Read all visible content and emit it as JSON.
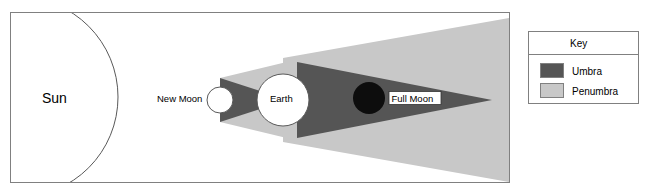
{
  "diagram": {
    "bodies": {
      "sun": {
        "label": "Sun"
      },
      "new_moon": {
        "label": "New Moon"
      },
      "earth": {
        "label": "Earth"
      },
      "full_moon": {
        "label": "Full Moon"
      }
    }
  },
  "legend": {
    "title": "Key",
    "items": [
      {
        "label": "Umbra",
        "color": "#555555"
      },
      {
        "label": "Penumbra",
        "color": "#c8c8c8"
      }
    ]
  },
  "colors": {
    "umbra": "#555555",
    "penumbra": "#c8c8c8",
    "full_moon": "#0d0d0d",
    "body_fill": "#ffffff",
    "stroke": "#595959",
    "frame": "#808080",
    "background": "#ffffff",
    "text": "#000000"
  }
}
